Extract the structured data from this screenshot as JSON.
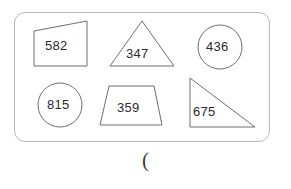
{
  "page": {
    "background_color": "#ffffff",
    "ink_color": "#2b2b2b",
    "shape_stroke_color": "#6e6e6e",
    "panel_border_color": "#b9b9b9"
  },
  "panel": {
    "name": "shapes-panel",
    "shape_count": 6
  },
  "shapes": [
    {
      "id": "shape-quadrilateral-582",
      "kind": "quadrilateral",
      "label": "582",
      "row": 1,
      "column": 1
    },
    {
      "id": "shape-triangle-347",
      "kind": "triangle",
      "label": "347",
      "row": 1,
      "column": 2
    },
    {
      "id": "shape-circle-436",
      "kind": "circle",
      "label": "436",
      "row": 1,
      "column": 3
    },
    {
      "id": "shape-circle-815",
      "kind": "circle",
      "label": "815",
      "row": 2,
      "column": 1
    },
    {
      "id": "shape-trapezoid-359",
      "kind": "trapezoid",
      "label": "359",
      "row": 2,
      "column": 2
    },
    {
      "id": "shape-right-triangle-675",
      "kind": "right-triangle",
      "label": "675",
      "row": 2,
      "column": 3
    }
  ],
  "footer": {
    "paren_mark": "("
  }
}
